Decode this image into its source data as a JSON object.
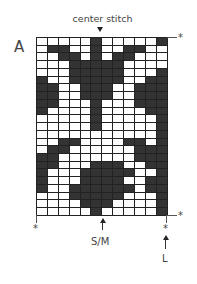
{
  "chart": {
    "letter": "A",
    "center_label": "center stitch",
    "marker_star": "*",
    "size_labels": {
      "sm": "S/M",
      "l": "L"
    },
    "columns": 12,
    "rows": 23,
    "colors": {
      "filled": "#333333",
      "empty": "#ffffff",
      "grid_line": "#222222"
    },
    "grid": [
      [
        0,
        0,
        0,
        0,
        0,
        1,
        0,
        0,
        0,
        0,
        0,
        1
      ],
      [
        0,
        1,
        1,
        0,
        0,
        1,
        0,
        0,
        1,
        1,
        0,
        0
      ],
      [
        0,
        0,
        1,
        1,
        0,
        1,
        0,
        1,
        1,
        0,
        0,
        0
      ],
      [
        0,
        0,
        0,
        1,
        1,
        1,
        1,
        1,
        0,
        0,
        0,
        0
      ],
      [
        0,
        0,
        0,
        1,
        1,
        1,
        1,
        1,
        0,
        0,
        0,
        1
      ],
      [
        1,
        0,
        0,
        1,
        1,
        1,
        1,
        1,
        0,
        0,
        1,
        1
      ],
      [
        1,
        1,
        0,
        0,
        1,
        1,
        1,
        0,
        0,
        1,
        1,
        1
      ],
      [
        1,
        1,
        0,
        0,
        1,
        1,
        1,
        0,
        0,
        1,
        1,
        1
      ],
      [
        1,
        1,
        0,
        0,
        0,
        1,
        0,
        0,
        0,
        1,
        1,
        1
      ],
      [
        1,
        0,
        0,
        0,
        0,
        1,
        0,
        0,
        0,
        0,
        1,
        1
      ],
      [
        0,
        0,
        0,
        0,
        0,
        1,
        0,
        0,
        0,
        0,
        0,
        1
      ],
      [
        0,
        0,
        0,
        0,
        0,
        1,
        0,
        0,
        0,
        0,
        0,
        1
      ],
      [
        0,
        0,
        0,
        0,
        0,
        0,
        0,
        0,
        0,
        0,
        0,
        1
      ],
      [
        0,
        0,
        1,
        1,
        0,
        0,
        0,
        0,
        1,
        1,
        0,
        1
      ],
      [
        0,
        1,
        1,
        0,
        0,
        0,
        0,
        0,
        0,
        1,
        1,
        1
      ],
      [
        1,
        1,
        0,
        0,
        0,
        0,
        0,
        0,
        0,
        1,
        1,
        1
      ],
      [
        1,
        1,
        0,
        0,
        0,
        1,
        1,
        1,
        0,
        0,
        1,
        1
      ],
      [
        1,
        0,
        0,
        0,
        1,
        1,
        1,
        1,
        1,
        0,
        0,
        1
      ],
      [
        1,
        0,
        0,
        0,
        1,
        1,
        1,
        1,
        0,
        0,
        1,
        1
      ],
      [
        1,
        0,
        0,
        1,
        1,
        1,
        1,
        1,
        1,
        0,
        1,
        1
      ],
      [
        0,
        0,
        0,
        1,
        1,
        1,
        1,
        1,
        0,
        0,
        0,
        1
      ],
      [
        0,
        0,
        0,
        0,
        1,
        1,
        1,
        0,
        0,
        0,
        0,
        1
      ],
      [
        0,
        0,
        0,
        0,
        0,
        1,
        0,
        0,
        0,
        0,
        0,
        1
      ]
    ]
  }
}
